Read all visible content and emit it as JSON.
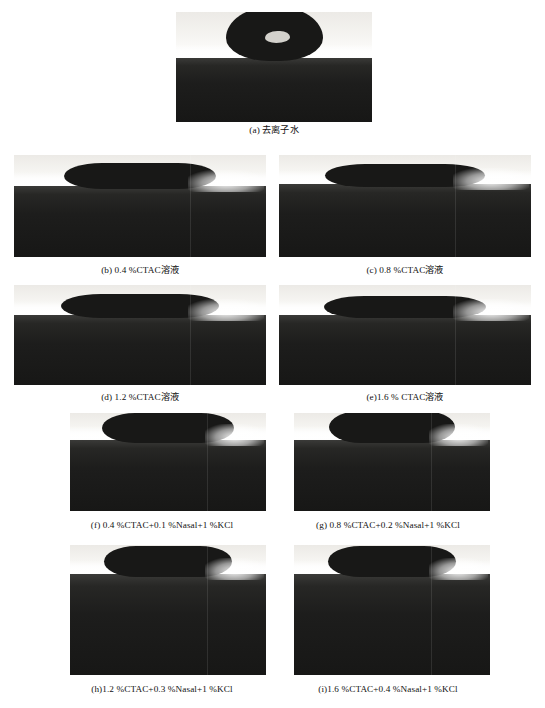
{
  "figure": {
    "panels": [
      {
        "id": "a",
        "caption": "(a) 去离子水",
        "liquid": "去离子水",
        "position": {
          "left": 176,
          "top": 12,
          "width": 196,
          "height": 110
        },
        "droplet": {
          "width": 97,
          "height": 55,
          "contact_angle_class": "high",
          "shape": "cap"
        },
        "substrate_height_ratio": 0.58
      },
      {
        "id": "b",
        "caption": "(b) 0.4 %CTAC溶液",
        "liquid": "0.4 %CTAC溶液",
        "position": {
          "left": 14,
          "top": 155,
          "width": 252,
          "height": 102
        },
        "droplet": {
          "width": 152,
          "height": 26,
          "contact_angle_class": "low",
          "shape": "lens"
        },
        "substrate_height_ratio": 0.7
      },
      {
        "id": "c",
        "caption": "(c) 0.8 %CTAC溶液",
        "liquid": "0.8 %CTAC溶液",
        "position": {
          "left": 279,
          "top": 155,
          "width": 252,
          "height": 102
        },
        "droplet": {
          "width": 160,
          "height": 23,
          "contact_angle_class": "low",
          "shape": "lens"
        },
        "substrate_height_ratio": 0.72
      },
      {
        "id": "d",
        "caption": "(d) 1.2 %CTAC溶液",
        "liquid": "1.2 %CTAC溶液",
        "position": {
          "left": 14,
          "top": 285,
          "width": 252,
          "height": 100
        },
        "droplet": {
          "width": 158,
          "height": 24,
          "contact_angle_class": "low",
          "shape": "lens"
        },
        "substrate_height_ratio": 0.7
      },
      {
        "id": "e",
        "caption": "(e)1.6 % CTAC溶液",
        "liquid": "1.6 % CTAC溶液",
        "position": {
          "left": 279,
          "top": 285,
          "width": 252,
          "height": 100
        },
        "droplet": {
          "width": 162,
          "height": 22,
          "contact_angle_class": "low",
          "shape": "lens"
        },
        "substrate_height_ratio": 0.7
      },
      {
        "id": "f",
        "caption": "(f) 0.4 %CTAC+0.1 %Nasal+1 %KCl",
        "liquid": "0.4 %CTAC+0.1 %Nasal+1 %KCl",
        "position": {
          "left": 70,
          "top": 413,
          "width": 196,
          "height": 98
        },
        "droplet": {
          "width": 132,
          "height": 30,
          "contact_angle_class": "low",
          "shape": "lens"
        },
        "substrate_height_ratio": 0.72
      },
      {
        "id": "g",
        "caption": "(g) 0.8 %CTAC+0.2 %Nasal+1 %KCl",
        "liquid": "0.8 %CTAC+0.2 %Nasal+1 %KCl",
        "position": {
          "left": 294,
          "top": 413,
          "width": 196,
          "height": 98
        },
        "droplet": {
          "width": 126,
          "height": 32,
          "contact_angle_class": "low",
          "shape": "lens"
        },
        "substrate_height_ratio": 0.72
      },
      {
        "id": "h",
        "caption": "(h)1.2 %CTAC+0.3 %Nasal+1 %KCl",
        "liquid": "1.2 %CTAC+0.3 %Nasal+1 %KCl",
        "position": {
          "left": 70,
          "top": 545,
          "width": 196,
          "height": 130
        },
        "droplet": {
          "width": 128,
          "height": 31,
          "contact_angle_class": "low",
          "shape": "lens"
        },
        "substrate_height_ratio": 0.78
      },
      {
        "id": "i",
        "caption": "(i)1.6 %CTAC+0.4 %Nasal+1 %KCl",
        "liquid": "1.6 %CTAC+0.4 %Nasal+1 %KCl",
        "position": {
          "left": 294,
          "top": 545,
          "width": 196,
          "height": 130
        },
        "droplet": {
          "width": 128,
          "height": 31,
          "contact_angle_class": "low",
          "shape": "lens"
        },
        "substrate_height_ratio": 0.78
      }
    ],
    "captions_layout": [
      {
        "id": "a",
        "left": 176,
        "top": 124,
        "width": 196
      },
      {
        "id": "b",
        "left": 14,
        "top": 264,
        "width": 252
      },
      {
        "id": "c",
        "left": 279,
        "top": 264,
        "width": 252
      },
      {
        "id": "d",
        "left": 14,
        "top": 391,
        "width": 252
      },
      {
        "id": "e",
        "left": 279,
        "top": 391,
        "width": 252
      },
      {
        "id": "f",
        "left": 36,
        "top": 519,
        "width": 252
      },
      {
        "id": "g",
        "left": 262,
        "top": 519,
        "width": 252
      },
      {
        "id": "h",
        "left": 36,
        "top": 683,
        "width": 252
      },
      {
        "id": "i",
        "left": 262,
        "top": 683,
        "width": 252
      }
    ],
    "colors": {
      "droplet": "#181817",
      "substrate": "#1d1d1c",
      "background": "#ffffff",
      "glow": "#ffffff",
      "caption_text": "#111111"
    }
  }
}
